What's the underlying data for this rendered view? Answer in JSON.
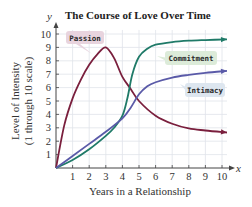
{
  "chart_data": {
    "type": "line",
    "title": "The Course of Love Over Time",
    "xlabel": "Years in a Relationship",
    "ylabel": "Level of Intensity (1 through 10 scale)",
    "ylabel_lines": [
      "Level of Intensity",
      "(1 through 10 scale)"
    ],
    "x_var": "x",
    "y_var": "y",
    "xlim": [
      0,
      10
    ],
    "ylim": [
      0,
      10
    ],
    "x_ticks": [
      "1",
      "2",
      "3",
      "4",
      "5",
      "6",
      "7",
      "8",
      "9",
      "10"
    ],
    "y_ticks": [
      "1",
      "2",
      "3",
      "4",
      "5",
      "6",
      "7",
      "8",
      "9",
      "10"
    ],
    "grid": true,
    "legend_position": "inline labels",
    "series": [
      {
        "name": "Passion",
        "color": "#7a1f3d",
        "label_bg": "#e8d4de",
        "x": [
          0,
          0.5,
          1,
          1.5,
          2,
          2.5,
          3,
          3.5,
          4,
          4.5,
          5,
          6,
          7,
          8,
          9,
          10.3
        ],
        "y": [
          0,
          3.2,
          5.2,
          6.6,
          7.7,
          8.5,
          9.0,
          8.2,
          6.8,
          5.9,
          5.0,
          3.9,
          3.3,
          2.95,
          2.8,
          2.65
        ]
      },
      {
        "name": "Commitment",
        "color": "#1f7a68",
        "label_bg": "#dcebd9",
        "x": [
          0,
          1,
          2,
          3,
          3.5,
          4,
          4.3,
          4.6,
          5,
          5.5,
          6,
          7,
          8,
          9,
          10.3
        ],
        "y": [
          0,
          0.6,
          1.4,
          2.4,
          3.0,
          3.9,
          5.2,
          7.0,
          8.3,
          8.9,
          9.2,
          9.4,
          9.5,
          9.55,
          9.6
        ]
      },
      {
        "name": "Intimacy",
        "color": "#5a5aa8",
        "label_bg": "#dde6ef",
        "x": [
          0,
          1,
          2,
          3,
          4,
          4.5,
          5,
          5.5,
          6,
          7,
          8,
          9,
          10.3
        ],
        "y": [
          0,
          0.9,
          1.8,
          2.7,
          3.7,
          4.5,
          5.5,
          6.1,
          6.4,
          6.75,
          6.95,
          7.1,
          7.25
        ]
      }
    ]
  }
}
